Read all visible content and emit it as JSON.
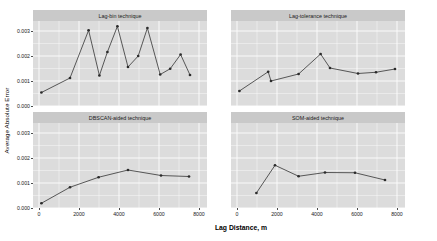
{
  "chart_data": {
    "type": "line",
    "title": "",
    "xlabel": "Lag Distance, m",
    "ylabel": "Average Absolute Error",
    "xlim": [
      -300,
      8400
    ],
    "ylim": [
      0.0,
      0.0034
    ],
    "xticks": [
      0,
      2000,
      4000,
      6000,
      8000
    ],
    "xticklabels": [
      "0",
      "2000",
      "4000",
      "6000",
      "8000"
    ],
    "yticks": [
      0.0,
      0.001,
      0.002,
      0.003
    ],
    "yticklabels": [
      "0.000",
      "0.001",
      "0.002",
      "0.003"
    ],
    "grid": true,
    "legend": "none",
    "marker": "filled-circle",
    "line_color": "#3d3d3d",
    "panel_background": "#dcdcdc",
    "strip_background": "#c9c9c9",
    "gridline_color": "#ffffff",
    "facets": [
      {
        "title": "Lag-bin technique",
        "row": 0,
        "col": 0,
        "x": [
          120,
          1550,
          2480,
          3020,
          3420,
          3920,
          4450,
          4960,
          5420,
          6060,
          6560,
          7080,
          7550
        ],
        "y": [
          0.00054,
          0.00112,
          0.00303,
          0.00122,
          0.00216,
          0.00319,
          0.00156,
          0.002,
          0.00312,
          0.00126,
          0.00149,
          0.00206,
          0.00124
        ]
      },
      {
        "title": "Lag-tolerance technique",
        "row": 0,
        "col": 1,
        "x": [
          120,
          1560,
          1700,
          3080,
          4180,
          4650,
          6050,
          6950,
          7900
        ],
        "y": [
          0.0006,
          0.00137,
          0.001,
          0.00128,
          0.00208,
          0.00152,
          0.0013,
          0.00135,
          0.00148
        ]
      },
      {
        "title": "DBSCAN-aided technique",
        "row": 1,
        "col": 0,
        "x": [
          120,
          1550,
          2980,
          4450,
          6100,
          7500
        ],
        "y": [
          0.00019,
          0.00083,
          0.00123,
          0.00152,
          0.0013,
          0.00126
        ]
      },
      {
        "title": "SOM-aided technique",
        "row": 1,
        "col": 1,
        "x": [
          970,
          1900,
          3080,
          4400,
          5900,
          7400
        ],
        "y": [
          0.0006,
          0.00171,
          0.00127,
          0.00142,
          0.00141,
          0.00112
        ]
      }
    ]
  }
}
